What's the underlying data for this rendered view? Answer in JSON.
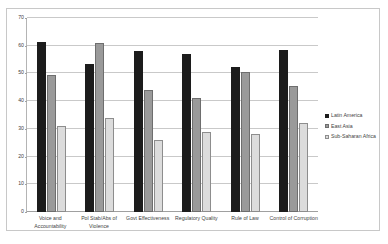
{
  "chart_data": {
    "type": "bar",
    "title": "",
    "xlabel": "",
    "ylabel": "",
    "ylim": [
      0,
      70
    ],
    "yticks": [
      0,
      10,
      20,
      30,
      40,
      50,
      60,
      70
    ],
    "grid": true,
    "legend_position": "right",
    "categories": [
      "Voice and Accountability",
      "Pol Stab/Abs of Violence",
      "Govt Effectiveness",
      "Regulatory Quality",
      "Rule of Law",
      "Control of Corruption"
    ],
    "series": [
      {
        "name": "Latin America",
        "color": "#1c1c1c",
        "values": [
          61.5,
          53.5,
          58.0,
          57.0,
          52.5,
          58.5
        ]
      },
      {
        "name": "East Asia",
        "color": "#9a9a9a",
        "values": [
          49.5,
          61.0,
          44.0,
          41.0,
          50.5,
          45.5
        ]
      },
      {
        "name": "Sub-Saharan Africa",
        "color": "#dcdcdc",
        "values": [
          31.0,
          34.0,
          26.0,
          29.0,
          28.0,
          32.0
        ]
      }
    ]
  }
}
